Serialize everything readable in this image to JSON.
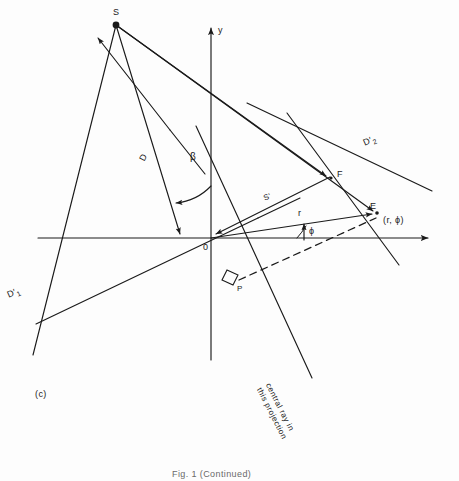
{
  "figure": {
    "panel_label": "(c)",
    "caption": "Fig. 1 (Continued)",
    "background_color": "#fdfdfd",
    "ink_color": "#1a1a1a"
  },
  "axes": {
    "y_axis_label": "y",
    "origin_label": "0",
    "x_axis": {
      "x1": 38,
      "y1": 238,
      "x2": 435,
      "y2": 238,
      "arrow": "right"
    },
    "y_axis": {
      "x1": 211,
      "y1": 22,
      "x2": 211,
      "y2": 360,
      "arrow": "up"
    }
  },
  "points": {
    "source": {
      "label": "S",
      "x": 116,
      "y": 25,
      "marker": "filled-dot"
    },
    "origin": {
      "label": "0",
      "x": 211,
      "y": 238
    },
    "focus": {
      "label": "F",
      "x": 331,
      "y": 178
    },
    "element": {
      "label": "E",
      "x": 378,
      "y": 213
    },
    "element_coords": {
      "label": "(r, ϕ)",
      "x": 386,
      "y": 221
    },
    "foot": {
      "label": "P",
      "x": 238,
      "y": 289
    }
  },
  "labels": {
    "D": "D",
    "D1_prime": {
      "base": "D",
      "prime": "′",
      "sub": "1"
    },
    "D2_prime": {
      "base": "D",
      "prime": "′",
      "sub": "2"
    },
    "beta": "β",
    "phi": "ϕ",
    "r": "r",
    "S_prime": "S'",
    "central_ray_line1": "central ray in",
    "central_ray_line2": "this projection"
  },
  "geometry": {
    "rays_from_source": [
      {
        "name": "ray-to-D1prime",
        "x2": 38,
        "y2": 322
      },
      {
        "name": "ray-to-origin-region",
        "x2": 186,
        "y2": 240
      },
      {
        "name": "ray-to-F",
        "x2": 331,
        "y2": 178
      },
      {
        "name": "ray-to-E",
        "x2": 378,
        "y2": 213
      }
    ],
    "detector_line_D1": {
      "x1": 38,
      "y1": 322,
      "x2": 250,
      "y2": 221
    },
    "detector_line_D2": {
      "x1": 250,
      "y1": 105,
      "x2": 428,
      "y2": 190
    },
    "central_ray": {
      "x1": 196,
      "y1": 128,
      "x2": 308,
      "y2": 372
    },
    "left_arrow_line": {
      "x1": 167,
      "y1": 122,
      "x2": 93,
      "y2": 33
    },
    "d2_cross_line": {
      "x1": 290,
      "y1": 118,
      "x2": 395,
      "y2": 261
    },
    "dashed_OP_E": [
      {
        "x": 234,
        "y": 279
      },
      {
        "x": 378,
        "y": 217
      }
    ],
    "right_angle_at_P": true,
    "phi_angle_deg": 13,
    "beta_angle_deg": 32
  }
}
